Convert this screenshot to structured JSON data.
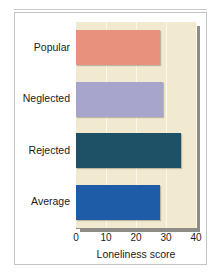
{
  "figure": {
    "top_ghost_text": "",
    "background_color": "#ffffff",
    "frame_color": "#c4c4c4",
    "plot_background_color": "#f2ead0",
    "shadow_color": "#8e8c87"
  },
  "chart_data": {
    "type": "bar",
    "orientation": "horizontal",
    "title": "",
    "xlabel": "Loneliness score",
    "ylabel": "",
    "xlim": [
      0,
      40
    ],
    "xticks": [
      0,
      10,
      20,
      30,
      40
    ],
    "xtick_labels": [
      "0",
      "10",
      "20",
      "30",
      "40"
    ],
    "grid": true,
    "grid_color": "#fdf8e8",
    "legend": false,
    "categories": [
      "Popular",
      "Neglected",
      "Rejected",
      "Average"
    ],
    "values": [
      28,
      29,
      35,
      28
    ],
    "bar_colors": [
      "#e8917d",
      "#a8a5cc",
      "#1f5166",
      "#1f5ca8"
    ],
    "bars": [
      {
        "label": "Popular",
        "value": 28,
        "color": "#e8917d"
      },
      {
        "label": "Neglected",
        "value": 29,
        "color": "#a8a5cc"
      },
      {
        "label": "Rejected",
        "value": 35,
        "color": "#1f5166"
      },
      {
        "label": "Average",
        "value": 28,
        "color": "#1f5ca8"
      }
    ]
  }
}
